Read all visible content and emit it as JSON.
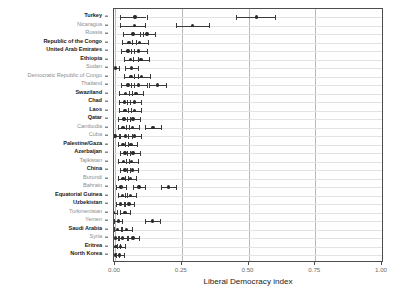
{
  "chart_data": {
    "type": "scatter",
    "title": "",
    "subtitle": "",
    "xlabel": "Liberal Democracy index",
    "ylabel": "",
    "xlim": [
      0.0,
      1.0
    ],
    "xticks": [
      0.0,
      0.25,
      0.5,
      0.75,
      1.0
    ],
    "xticklabels": [
      "0.00",
      "0.25",
      "0.50",
      "0.75",
      "1.00"
    ],
    "grid": "vertical major gridlines at x ticks, faint horizontal gridlines at each category",
    "legend": "none",
    "orientation": "horizontal dot-and-error-bar (forest) plot",
    "error_bars": "horizontal range bars with end caps around each point estimate",
    "categories": [
      "Turkey",
      "Nicaragua",
      "Russia",
      "Republic of the Congo",
      "United Arab Emirates",
      "Ethiopia",
      "Sudan",
      "Democratic Republic of Congo",
      "Thailand",
      "Swaziland",
      "Chad",
      "Laos",
      "Qatar",
      "Cambodia",
      "Cuba",
      "Palestine/Gaza",
      "Azerbaijan",
      "Tajikistan",
      "China",
      "Burundi",
      "Bahrain",
      "Equatorial Guinea",
      "Uzbekistan",
      "Turkmenistan",
      "Yemen",
      "Saudi Arabia",
      "Syria",
      "Eritrea",
      "North Korea"
    ],
    "label_emphasis": [
      "dark",
      "light",
      "light",
      "dark",
      "dark",
      "dark",
      "light",
      "light",
      "light",
      "dark",
      "dark",
      "dark",
      "dark",
      "light",
      "light",
      "dark",
      "dark",
      "light",
      "dark",
      "light",
      "light",
      "dark",
      "dark",
      "light",
      "light",
      "dark",
      "light",
      "dark",
      "dark"
    ],
    "points": [
      {
        "category": "Turkey",
        "values": [
          0.075,
          0.53
        ],
        "low": [
          0.02,
          0.455
        ],
        "high": [
          0.118,
          0.6
        ]
      },
      {
        "category": "Nicaragua",
        "values": [
          0.072,
          0.29
        ],
        "low": [
          0.018,
          0.228
        ],
        "high": [
          0.112,
          0.352
        ]
      },
      {
        "category": "Russia",
        "values": [
          0.068,
          0.12
        ],
        "low": [
          0.03,
          0.092
        ],
        "high": [
          0.105,
          0.148
        ]
      },
      {
        "category": "Republic of the Congo",
        "values": [
          0.052,
          0.092
        ],
        "low": [
          0.028,
          0.062
        ],
        "high": [
          0.078,
          0.122
        ]
      },
      {
        "category": "United Arab Emirates",
        "values": [
          0.048,
          0.088
        ],
        "low": [
          0.022,
          0.06
        ],
        "high": [
          0.072,
          0.118
        ]
      },
      {
        "category": "Ethiopia",
        "values": [
          0.058,
          0.098
        ],
        "low": [
          0.032,
          0.068
        ],
        "high": [
          0.085,
          0.128
        ]
      },
      {
        "category": "Sudan",
        "values": [
          0.002,
          0.062
        ],
        "low": [
          -0.012,
          0.038
        ],
        "high": [
          0.016,
          0.088
        ]
      },
      {
        "category": "Democratic Republic of Congo",
        "values": [
          0.06,
          0.1
        ],
        "low": [
          0.035,
          0.072
        ],
        "high": [
          0.086,
          0.13
        ]
      },
      {
        "category": "Thailand",
        "values": [
          0.048,
          0.088,
          0.16
        ],
        "low": [
          0.022,
          0.06,
          0.128
        ],
        "high": [
          0.072,
          0.118,
          0.192
        ]
      },
      {
        "category": "Swaziland",
        "values": [
          0.04,
          0.078
        ],
        "low": [
          0.016,
          0.052
        ],
        "high": [
          0.064,
          0.105
        ]
      },
      {
        "category": "Chad",
        "values": [
          0.035,
          0.072
        ],
        "low": [
          0.014,
          0.046
        ],
        "high": [
          0.058,
          0.098
        ]
      },
      {
        "category": "Laos",
        "values": [
          0.038,
          0.072
        ],
        "low": [
          0.015,
          0.048
        ],
        "high": [
          0.06,
          0.098
        ]
      },
      {
        "category": "Qatar",
        "values": [
          0.034,
          0.068
        ],
        "low": [
          0.012,
          0.044
        ],
        "high": [
          0.056,
          0.094
        ]
      },
      {
        "category": "Cambodia",
        "values": [
          0.03,
          0.065,
          0.142
        ],
        "low": [
          0.01,
          0.04,
          0.112
        ],
        "high": [
          0.052,
          0.09,
          0.172
        ]
      },
      {
        "category": "Cuba",
        "values": [
          0.0,
          0.04,
          0.072
        ],
        "low": [
          -0.014,
          0.018,
          0.048
        ],
        "high": [
          0.014,
          0.062,
          0.098
        ]
      },
      {
        "category": "Palestine/Gaza",
        "values": [
          0.03,
          0.06
        ],
        "low": [
          0.01,
          0.038
        ],
        "high": [
          0.05,
          0.084
        ]
      },
      {
        "category": "Azerbaijan",
        "values": [
          0.038,
          0.068
        ],
        "low": [
          0.018,
          0.045
        ],
        "high": [
          0.058,
          0.092
        ]
      },
      {
        "category": "Tajikistan",
        "values": [
          0.032,
          0.062
        ],
        "low": [
          0.013,
          0.04
        ],
        "high": [
          0.052,
          0.085
        ]
      },
      {
        "category": "China",
        "values": [
          0.038,
          0.065
        ],
        "low": [
          0.02,
          0.044
        ],
        "high": [
          0.057,
          0.088
        ]
      },
      {
        "category": "Burundi",
        "values": [
          0.03,
          0.058
        ],
        "low": [
          0.012,
          0.038
        ],
        "high": [
          0.048,
          0.08
        ]
      },
      {
        "category": "Bahrain",
        "values": [
          0.022,
          0.09,
          0.2
        ],
        "low": [
          0.004,
          0.068,
          0.172
        ],
        "high": [
          0.04,
          0.112,
          0.228
        ]
      },
      {
        "category": "Equatorial Guinea",
        "values": [
          0.028,
          0.058
        ],
        "low": [
          0.01,
          0.038
        ],
        "high": [
          0.046,
          0.078
        ]
      },
      {
        "category": "Uzbekistan",
        "values": [
          0.02,
          0.052
        ],
        "low": [
          0.004,
          0.032
        ],
        "high": [
          0.038,
          0.072
        ]
      },
      {
        "category": "Turkmenistan",
        "values": [
          -0.008,
          0.038
        ],
        "low": [
          -0.022,
          0.02
        ],
        "high": [
          0.006,
          0.058
        ]
      },
      {
        "category": "Yemen",
        "values": [
          0.012,
          0.14
        ],
        "low": [
          -0.002,
          0.112
        ],
        "high": [
          0.028,
          0.168
        ]
      },
      {
        "category": "Saudi Arabia",
        "values": [
          0.01,
          0.042
        ],
        "low": [
          -0.004,
          0.024
        ],
        "high": [
          0.026,
          0.062
        ]
      },
      {
        "category": "Syria",
        "values": [
          0.002,
          0.028,
          0.068
        ],
        "low": [
          -0.012,
          0.012,
          0.048
        ],
        "high": [
          0.016,
          0.046,
          0.09
        ]
      },
      {
        "category": "Eritrea",
        "values": [
          0.004,
          0.02
        ],
        "low": [
          -0.008,
          0.006
        ],
        "high": [
          0.018,
          0.036
        ]
      },
      {
        "category": "North Korea",
        "values": [
          0.002,
          0.018
        ],
        "low": [
          -0.01,
          0.004
        ],
        "high": [
          0.014,
          0.032
        ]
      }
    ],
    "colors": {
      "point": "#2b2b2b",
      "error_bar": "#3a3a3a",
      "panel_border": "#4d4d4d",
      "vertical_gridline": "#b9b9b9",
      "horizontal_gridline": "#e3e3e3",
      "label_dark": "#1a1a1a",
      "label_light": "#8d8d8d",
      "tick_label": "#6e6e6e",
      "background": "#ffffff"
    }
  }
}
